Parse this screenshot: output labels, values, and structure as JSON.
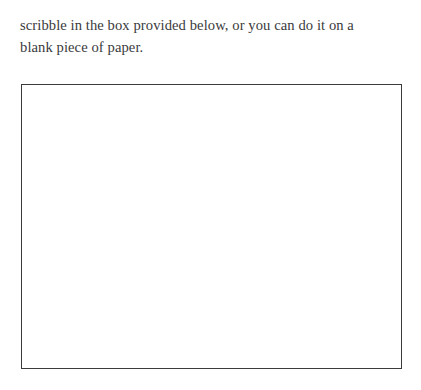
{
  "document": {
    "background_color": "#ffffff",
    "text_color": "#3a3a3c",
    "border_color": "#3b3b3d"
  },
  "instructions": {
    "line1": "scribble in the box provided below, or you can do it on a",
    "line2": "blank piece of paper."
  },
  "answer_box": {
    "label": "blank answer area",
    "content": ""
  }
}
